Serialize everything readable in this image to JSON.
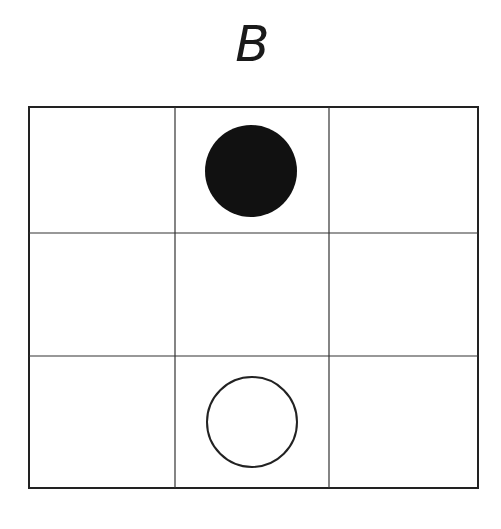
{
  "title": "B",
  "grid": {
    "rows": 3,
    "cols": 3,
    "x_lines": [
      29,
      175,
      329,
      478
    ],
    "y_lines": [
      107,
      233,
      356,
      488
    ],
    "line_color": "#333333"
  },
  "pieces": [
    {
      "row": 0,
      "col": 1,
      "type": "filled-circle",
      "cx": 251,
      "cy": 171,
      "r": 46,
      "fill": "#111111"
    },
    {
      "row": 2,
      "col": 1,
      "type": "open-circle",
      "cx": 252,
      "cy": 422,
      "r": 45,
      "stroke": "#222222"
    }
  ]
}
